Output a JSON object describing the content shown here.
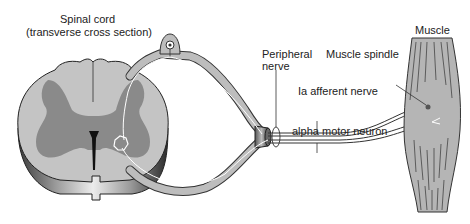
{
  "labels": {
    "spinal_cord_title": "Spinal cord",
    "spinal_cord_subtitle": "(transverse cross section)",
    "peripheral_nerve_line1": "Peripheral",
    "peripheral_nerve_line2": "nerve",
    "muscle_spindle": "Muscle spindle",
    "muscle": "Muscle",
    "ia_afferent": "Ia afferent nerve",
    "alpha_motor": "alpha motor neuron"
  },
  "colors": {
    "white_matter": "#c4c4c4",
    "gray_matter": "#8a8a8a",
    "nerve_fill": "#bdbdbd",
    "muscle_fill": "#b5b5b5",
    "outline": "#333333"
  }
}
